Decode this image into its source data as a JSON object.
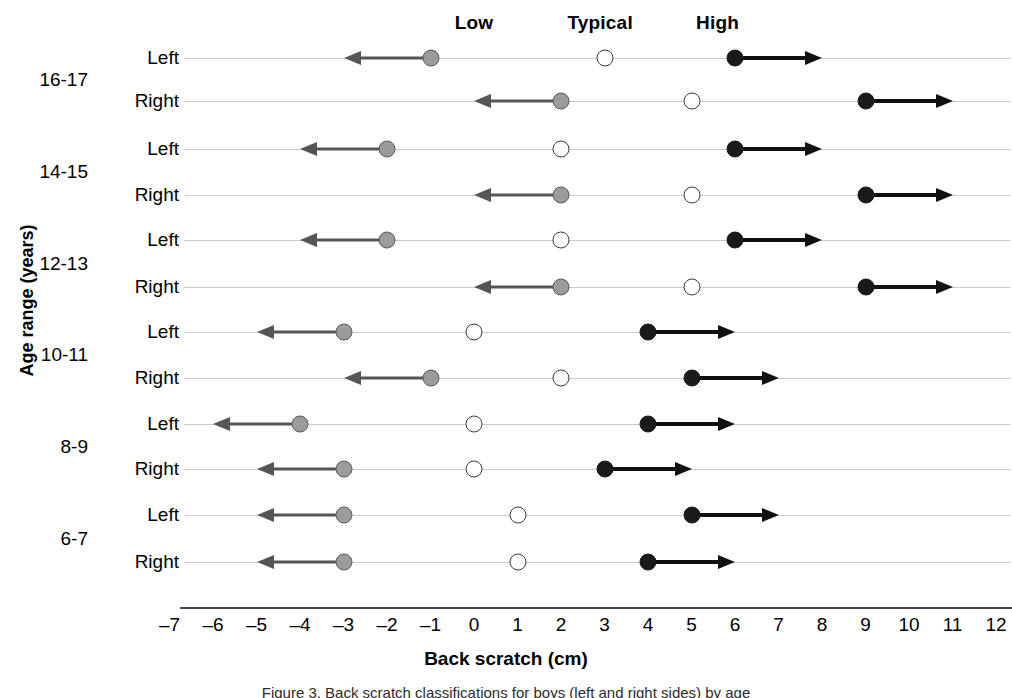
{
  "chart_data": {
    "type": "dumbbell",
    "title": "",
    "xlabel": "Back scratch (cm)",
    "ylabel": "Age range (years)",
    "xlim": [
      -7.6,
      12.6
    ],
    "xticks": [
      -7,
      -6,
      -5,
      -4,
      -3,
      -2,
      -1,
      0,
      1,
      2,
      3,
      4,
      5,
      6,
      7,
      8,
      9,
      10,
      11,
      12
    ],
    "xtick_labels": [
      "–7",
      "–6",
      "–5",
      "–4",
      "–3",
      "–2",
      "–1",
      "0",
      "1",
      "2",
      "3",
      "4",
      "5",
      "6",
      "7",
      "8",
      "9",
      "10",
      "11",
      "12"
    ],
    "grid": true,
    "legend_position": "top",
    "zone_headers": [
      {
        "label": "Low",
        "x": 0.0
      },
      {
        "label": "Typical",
        "x": 2.9
      },
      {
        "label": "High",
        "x": 5.6
      }
    ],
    "series_names": [
      "Low",
      "Typical",
      "High"
    ],
    "groups": [
      {
        "label": "16-17",
        "rows": [
          {
            "side": "Left",
            "low": -1,
            "low_arrow_to": -3,
            "typical": 3,
            "high": 6,
            "high_arrow_to": 8
          },
          {
            "side": "Right",
            "low": 2,
            "low_arrow_to": 0,
            "typical": 5,
            "high": 9,
            "high_arrow_to": 11
          }
        ]
      },
      {
        "label": "14-15",
        "rows": [
          {
            "side": "Left",
            "low": -2,
            "low_arrow_to": -4,
            "typical": 2,
            "high": 6,
            "high_arrow_to": 8
          },
          {
            "side": "Right",
            "low": 2,
            "low_arrow_to": 0,
            "typical": 5,
            "high": 9,
            "high_arrow_to": 11
          }
        ]
      },
      {
        "label": "12-13",
        "rows": [
          {
            "side": "Left",
            "low": -2,
            "low_arrow_to": -4,
            "typical": 2,
            "high": 6,
            "high_arrow_to": 8
          },
          {
            "side": "Right",
            "low": 2,
            "low_arrow_to": 0,
            "typical": 5,
            "high": 9,
            "high_arrow_to": 11
          }
        ]
      },
      {
        "label": "10-11",
        "rows": [
          {
            "side": "Left",
            "low": -3,
            "low_arrow_to": -5,
            "typical": 0,
            "high": 4,
            "high_arrow_to": 6
          },
          {
            "side": "Right",
            "low": -1,
            "low_arrow_to": -3,
            "typical": 2,
            "high": 5,
            "high_arrow_to": 7
          }
        ]
      },
      {
        "label": "8-9",
        "rows": [
          {
            "side": "Left",
            "low": -4,
            "low_arrow_to": -6,
            "typical": 0,
            "high": 4,
            "high_arrow_to": 6
          },
          {
            "side": "Right",
            "low": -3,
            "low_arrow_to": -5,
            "typical": 0,
            "high": 3,
            "high_arrow_to": 5
          }
        ]
      },
      {
        "label": "6-7",
        "rows": [
          {
            "side": "Left",
            "low": -3,
            "low_arrow_to": -5,
            "typical": 1,
            "high": 5,
            "high_arrow_to": 7
          },
          {
            "side": "Right",
            "low": -3,
            "low_arrow_to": -5,
            "typical": 1,
            "high": 4,
            "high_arrow_to": 6
          }
        ]
      }
    ],
    "colors": {
      "low_fill": "#9b9b9b",
      "low_stroke": "#5a5a5a",
      "typical_fill": "#ffffff",
      "typical_stroke": "#3a3a3a",
      "high_fill": "#1a1a1a",
      "gridline": "#c9c9c9",
      "axis": "#4a4a4a"
    }
  },
  "caption": "Figure 3. Back scratch classifications for boys (left and right sides) by age"
}
